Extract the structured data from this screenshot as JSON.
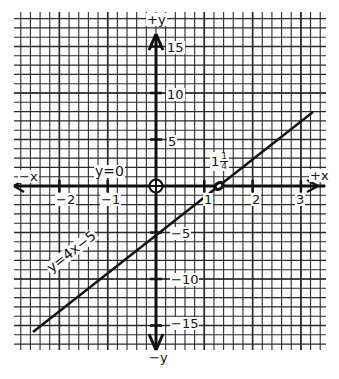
{
  "chart_data": {
    "type": "line",
    "title": "",
    "series": [
      {
        "name": "y=4x-5",
        "equation": "y = 4x - 5",
        "x": [
          -2.56,
          3.27
        ],
        "y": [
          -15.24,
          8.08
        ]
      }
    ],
    "annotations": [
      {
        "text": "y=4x-5",
        "position": "along line, lower left"
      },
      {
        "text": "y=0",
        "position": "above x-axis near x=-1"
      },
      {
        "text": "1 1/4",
        "position": "x-intercept at x=1.25"
      }
    ],
    "points": [
      {
        "name": "origin",
        "x": 0,
        "y": 0,
        "marker": "circle-cross"
      },
      {
        "name": "x-intercept",
        "x": 1.25,
        "y": 0,
        "marker": "filled-ellipse"
      }
    ],
    "axes": {
      "x": {
        "label_positive": "+x",
        "label_negative": "−x",
        "ticks": [
          -2,
          -1,
          1,
          2,
          3
        ],
        "tick_labels": [
          "−2",
          "−1",
          "1",
          "2",
          "3"
        ],
        "range": [
          -2.95,
          3.5
        ]
      },
      "y": {
        "label_positive": "+y",
        "label_negative": "−y",
        "ticks": [
          15,
          10,
          5,
          -5,
          -10,
          -15
        ],
        "tick_labels": [
          "15",
          "10",
          "5",
          "−5",
          "−10",
          "−15"
        ],
        "range": [
          -18,
          18.5
        ]
      }
    },
    "grid": true,
    "grid_minor_x": 0.2,
    "grid_minor_y": 1
  },
  "labels": {
    "plus_y": "+y",
    "minus_y": "−y",
    "plus_x": "+x",
    "minus_x": "−x",
    "y_zero": "y=0",
    "equation": "y=4x−5",
    "intercept_whole": "1",
    "intercept_num": "1",
    "intercept_den": "4",
    "xt_m2": "−2",
    "xt_m1": "−1",
    "xt_1": "1",
    "xt_2": "2",
    "xt_3": "3",
    "yt_15": "15",
    "yt_10": "10",
    "yt_5": "5",
    "yt_m5": "−5",
    "yt_m10": "−10",
    "yt_m15": "−15"
  },
  "colors": {
    "ink": "#111111",
    "grid": "#2a2a2a",
    "paper": "#ffffff"
  }
}
